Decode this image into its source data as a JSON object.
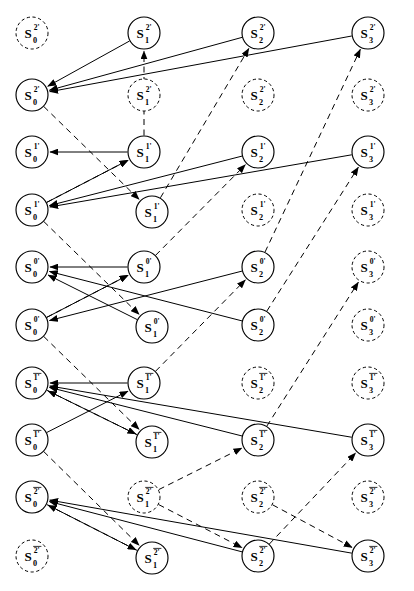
{
  "diagram": {
    "type": "trellis-graph",
    "width": 414,
    "height": 591,
    "background_color": "#ffffff",
    "line_color": "#000000",
    "columns": [
      {
        "index": 0,
        "subscript": "0",
        "x": 32
      },
      {
        "index": 1,
        "subscript": "1",
        "x": 144
      },
      {
        "index": 2,
        "subscript": "2",
        "x": 258
      },
      {
        "index": 3,
        "subscript": "3",
        "x": 368
      }
    ],
    "rows": [
      {
        "index": 0,
        "superscript": "2'",
        "overbar": false,
        "y": 33
      },
      {
        "index": 1,
        "superscript": "2'",
        "overbar": false,
        "y": 95
      },
      {
        "index": 2,
        "superscript": "1'",
        "overbar": false,
        "y": 152
      },
      {
        "index": 3,
        "superscript": "1'",
        "overbar": false,
        "y": 210
      },
      {
        "index": 4,
        "superscript": "0'",
        "overbar": false,
        "y": 267
      },
      {
        "index": 5,
        "superscript": "0'",
        "overbar": false,
        "y": 325
      },
      {
        "index": 6,
        "superscript": "1'",
        "overbar": true,
        "y": 383
      },
      {
        "index": 7,
        "superscript": "1'",
        "overbar": true,
        "y": 440
      },
      {
        "index": 8,
        "superscript": "2'",
        "overbar": true,
        "y": 497
      },
      {
        "index": 9,
        "superscript": "2'",
        "overbar": true,
        "y": 556
      }
    ],
    "node_symbol": "S",
    "node_radius": 16,
    "nodes": [
      {
        "id": "r0c0",
        "row": 0,
        "col": 0,
        "x": 32,
        "y": 33,
        "style": "dashed",
        "label": "S",
        "sup": "2'",
        "sub": "0",
        "overbar": false
      },
      {
        "id": "r0c1",
        "row": 0,
        "col": 1,
        "x": 144,
        "y": 33,
        "style": "solid",
        "label": "S",
        "sup": "2'",
        "sub": "1",
        "overbar": false
      },
      {
        "id": "r0c2",
        "row": 0,
        "col": 2,
        "x": 258,
        "y": 33,
        "style": "solid",
        "label": "S",
        "sup": "2'",
        "sub": "2",
        "overbar": false
      },
      {
        "id": "r0c3",
        "row": 0,
        "col": 3,
        "x": 368,
        "y": 33,
        "style": "solid",
        "label": "S",
        "sup": "2'",
        "sub": "3",
        "overbar": false
      },
      {
        "id": "r1c0",
        "row": 1,
        "col": 0,
        "x": 32,
        "y": 95,
        "style": "solid",
        "label": "S",
        "sup": "2'",
        "sub": "0",
        "overbar": false
      },
      {
        "id": "r1c1",
        "row": 1,
        "col": 1,
        "x": 144,
        "y": 95,
        "style": "dashed",
        "label": "S",
        "sup": "2'",
        "sub": "1",
        "overbar": false
      },
      {
        "id": "r1c2",
        "row": 1,
        "col": 2,
        "x": 258,
        "y": 95,
        "style": "dashed",
        "label": "S",
        "sup": "2'",
        "sub": "2",
        "overbar": false
      },
      {
        "id": "r1c3",
        "row": 1,
        "col": 3,
        "x": 368,
        "y": 95,
        "style": "dashed",
        "label": "S",
        "sup": "2'",
        "sub": "3",
        "overbar": false
      },
      {
        "id": "r2c0",
        "row": 2,
        "col": 0,
        "x": 32,
        "y": 152,
        "style": "solid",
        "label": "S",
        "sup": "1'",
        "sub": "0",
        "overbar": false
      },
      {
        "id": "r2c1",
        "row": 2,
        "col": 1,
        "x": 144,
        "y": 152,
        "style": "solid",
        "label": "S",
        "sup": "1'",
        "sub": "1",
        "overbar": false
      },
      {
        "id": "r2c2",
        "row": 2,
        "col": 2,
        "x": 258,
        "y": 152,
        "style": "solid",
        "label": "S",
        "sup": "1'",
        "sub": "2",
        "overbar": false
      },
      {
        "id": "r2c3",
        "row": 2,
        "col": 3,
        "x": 368,
        "y": 152,
        "style": "solid",
        "label": "S",
        "sup": "1'",
        "sub": "3",
        "overbar": false
      },
      {
        "id": "r3c0",
        "row": 3,
        "col": 0,
        "x": 32,
        "y": 210,
        "style": "solid",
        "label": "S",
        "sup": "1'",
        "sub": "0",
        "overbar": false
      },
      {
        "id": "r3c1",
        "row": 3,
        "col": 1,
        "x": 152,
        "y": 212,
        "style": "solid",
        "label": "S",
        "sup": "1'",
        "sub": "1",
        "overbar": false
      },
      {
        "id": "r3c2",
        "row": 3,
        "col": 2,
        "x": 258,
        "y": 210,
        "style": "dashed",
        "label": "S",
        "sup": "1'",
        "sub": "2",
        "overbar": false
      },
      {
        "id": "r3c3",
        "row": 3,
        "col": 3,
        "x": 368,
        "y": 210,
        "style": "dashed",
        "label": "S",
        "sup": "1'",
        "sub": "3",
        "overbar": false
      },
      {
        "id": "r4c0",
        "row": 4,
        "col": 0,
        "x": 32,
        "y": 267,
        "style": "solid",
        "label": "S",
        "sup": "0'",
        "sub": "0",
        "overbar": false
      },
      {
        "id": "r4c1",
        "row": 4,
        "col": 1,
        "x": 144,
        "y": 267,
        "style": "solid",
        "label": "S",
        "sup": "0'",
        "sub": "1",
        "overbar": false
      },
      {
        "id": "r4c2",
        "row": 4,
        "col": 2,
        "x": 258,
        "y": 267,
        "style": "solid",
        "label": "S",
        "sup": "0'",
        "sub": "2",
        "overbar": false
      },
      {
        "id": "r4c3",
        "row": 4,
        "col": 3,
        "x": 368,
        "y": 267,
        "style": "dashed",
        "label": "S",
        "sup": "0'",
        "sub": "3",
        "overbar": false
      },
      {
        "id": "r5c0",
        "row": 5,
        "col": 0,
        "x": 32,
        "y": 325,
        "style": "solid",
        "label": "S",
        "sup": "0'",
        "sub": "0",
        "overbar": false
      },
      {
        "id": "r5c1",
        "row": 5,
        "col": 1,
        "x": 152,
        "y": 327,
        "style": "solid",
        "label": "S",
        "sup": "0'",
        "sub": "1",
        "overbar": false
      },
      {
        "id": "r5c2",
        "row": 5,
        "col": 2,
        "x": 258,
        "y": 325,
        "style": "solid",
        "label": "S",
        "sup": "0'",
        "sub": "2",
        "overbar": false
      },
      {
        "id": "r5c3",
        "row": 5,
        "col": 3,
        "x": 368,
        "y": 325,
        "style": "dashed",
        "label": "S",
        "sup": "0'",
        "sub": "3",
        "overbar": false
      },
      {
        "id": "r6c0",
        "row": 6,
        "col": 0,
        "x": 32,
        "y": 383,
        "style": "solid",
        "label": "S",
        "sup": "1'",
        "sub": "0",
        "overbar": true
      },
      {
        "id": "r6c1",
        "row": 6,
        "col": 1,
        "x": 144,
        "y": 383,
        "style": "solid",
        "label": "S",
        "sup": "1'",
        "sub": "1",
        "overbar": true
      },
      {
        "id": "r6c2",
        "row": 6,
        "col": 2,
        "x": 258,
        "y": 383,
        "style": "dashed",
        "label": "S",
        "sup": "1'",
        "sub": "2",
        "overbar": true
      },
      {
        "id": "r6c3",
        "row": 6,
        "col": 3,
        "x": 368,
        "y": 383,
        "style": "dashed",
        "label": "S",
        "sup": "1'",
        "sub": "3",
        "overbar": true
      },
      {
        "id": "r7c0",
        "row": 7,
        "col": 0,
        "x": 32,
        "y": 440,
        "style": "solid",
        "label": "S",
        "sup": "1'",
        "sub": "0",
        "overbar": true
      },
      {
        "id": "r7c1",
        "row": 7,
        "col": 1,
        "x": 152,
        "y": 442,
        "style": "solid",
        "label": "S",
        "sup": "1'",
        "sub": "1",
        "overbar": true
      },
      {
        "id": "r7c2",
        "row": 7,
        "col": 2,
        "x": 258,
        "y": 440,
        "style": "solid",
        "label": "S",
        "sup": "1'",
        "sub": "2",
        "overbar": true
      },
      {
        "id": "r7c3",
        "row": 7,
        "col": 3,
        "x": 368,
        "y": 440,
        "style": "solid",
        "label": "S",
        "sup": "1'",
        "sub": "3",
        "overbar": true
      },
      {
        "id": "r8c0",
        "row": 8,
        "col": 0,
        "x": 32,
        "y": 497,
        "style": "solid",
        "label": "S",
        "sup": "2'",
        "sub": "0",
        "overbar": true
      },
      {
        "id": "r8c1",
        "row": 8,
        "col": 1,
        "x": 144,
        "y": 497,
        "style": "dashed",
        "label": "S",
        "sup": "2'",
        "sub": "1",
        "overbar": true
      },
      {
        "id": "r8c2",
        "row": 8,
        "col": 2,
        "x": 258,
        "y": 497,
        "style": "dashed",
        "label": "S",
        "sup": "2'",
        "sub": "2",
        "overbar": true
      },
      {
        "id": "r8c3",
        "row": 8,
        "col": 3,
        "x": 368,
        "y": 497,
        "style": "dashed",
        "label": "S",
        "sup": "2'",
        "sub": "3",
        "overbar": true
      },
      {
        "id": "r9c0",
        "row": 9,
        "col": 0,
        "x": 32,
        "y": 556,
        "style": "dashed",
        "label": "S",
        "sup": "2'",
        "sub": "0",
        "overbar": true
      },
      {
        "id": "r9c1",
        "row": 9,
        "col": 1,
        "x": 152,
        "y": 558,
        "style": "solid",
        "label": "S",
        "sup": "2'",
        "sub": "1",
        "overbar": true
      },
      {
        "id": "r9c2",
        "row": 9,
        "col": 2,
        "x": 258,
        "y": 556,
        "style": "solid",
        "label": "S",
        "sup": "2'",
        "sub": "2",
        "overbar": true
      },
      {
        "id": "r9c3",
        "row": 9,
        "col": 3,
        "x": 368,
        "y": 556,
        "style": "solid",
        "label": "S",
        "sup": "2'",
        "sub": "3",
        "overbar": true
      }
    ],
    "edges": [
      {
        "from": "r0c1",
        "to": "r1c0",
        "style": "solid"
      },
      {
        "from": "r0c2",
        "to": "r1c0",
        "style": "solid"
      },
      {
        "from": "r0c3",
        "to": "r1c0",
        "style": "solid"
      },
      {
        "from": "r2c1",
        "to": "r0c1",
        "style": "dashed"
      },
      {
        "from": "r3c1",
        "to": "r0c2",
        "style": "dashed"
      },
      {
        "from": "r4c2",
        "to": "r0c3",
        "style": "dashed"
      },
      {
        "from": "r2c1",
        "to": "r2c0",
        "style": "solid"
      },
      {
        "from": "r2c2",
        "to": "r3c0",
        "style": "solid"
      },
      {
        "from": "r2c3",
        "to": "r3c0",
        "style": "solid"
      },
      {
        "from": "r3c0",
        "to": "r2c1",
        "style": "solid"
      },
      {
        "from": "r1c0",
        "to": "r3c1",
        "style": "dashed"
      },
      {
        "from": "r3c0",
        "to": "r2c1",
        "style": "dashed"
      },
      {
        "from": "r4c1",
        "to": "r2c2",
        "style": "dashed"
      },
      {
        "from": "r5c2",
        "to": "r2c3",
        "style": "dashed"
      },
      {
        "from": "r4c1",
        "to": "r4c0",
        "style": "solid"
      },
      {
        "from": "r4c2",
        "to": "r5c0",
        "style": "solid"
      },
      {
        "from": "r5c0",
        "to": "r4c1",
        "style": "solid"
      },
      {
        "from": "r5c1",
        "to": "r4c0",
        "style": "solid"
      },
      {
        "from": "r5c2",
        "to": "r4c0",
        "style": "solid"
      },
      {
        "from": "r3c0",
        "to": "r5c1",
        "style": "dashed"
      },
      {
        "from": "r5c0",
        "to": "r4c1",
        "style": "dashed"
      },
      {
        "from": "r6c1",
        "to": "r4c2",
        "style": "dashed"
      },
      {
        "from": "r7c2",
        "to": "r4c3",
        "style": "dashed"
      },
      {
        "from": "r6c1",
        "to": "r6c0",
        "style": "solid"
      },
      {
        "from": "r7c0",
        "to": "r6c1",
        "style": "solid"
      },
      {
        "from": "r7c1",
        "to": "r6c0",
        "style": "solid"
      },
      {
        "from": "r7c2",
        "to": "r6c0",
        "style": "solid"
      },
      {
        "from": "r7c3",
        "to": "r6c0",
        "style": "solid"
      },
      {
        "from": "r5c0",
        "to": "r7c1",
        "style": "dashed"
      },
      {
        "from": "r6c0",
        "to": "r7c1",
        "style": "dashed"
      },
      {
        "from": "r8c1",
        "to": "r7c2",
        "style": "dashed"
      },
      {
        "from": "r9c2",
        "to": "r7c3",
        "style": "dashed"
      },
      {
        "from": "r9c1",
        "to": "r8c0",
        "style": "solid"
      },
      {
        "from": "r9c2",
        "to": "r8c0",
        "style": "solid"
      },
      {
        "from": "r9c3",
        "to": "r8c0",
        "style": "solid"
      },
      {
        "from": "r7c0",
        "to": "r9c1",
        "style": "dashed"
      },
      {
        "from": "r8c0",
        "to": "r9c1",
        "style": "dashed"
      },
      {
        "from": "r8c1",
        "to": "r9c2",
        "style": "dashed"
      },
      {
        "from": "r8c2",
        "to": "r9c3",
        "style": "dashed"
      }
    ]
  }
}
